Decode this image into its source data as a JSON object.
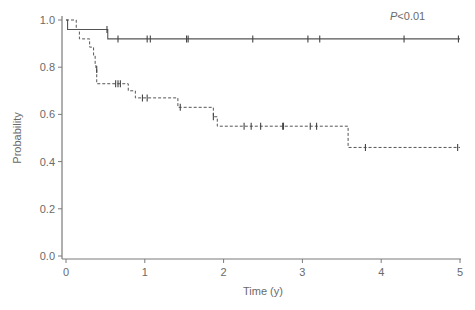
{
  "chart_data": {
    "type": "line",
    "subtype": "kaplan-meier step",
    "title": "",
    "xlabel": "Time (y)",
    "ylabel": "Probability",
    "xlim": [
      0,
      5
    ],
    "ylim": [
      0,
      1.0
    ],
    "xticks": [
      "0",
      "1",
      "2",
      "3",
      "4",
      "5"
    ],
    "yticks": [
      "0.0",
      "0.2",
      "0.4",
      "0.6",
      "0.8",
      "1.0"
    ],
    "grid": false,
    "legend": null,
    "annotations": [
      {
        "text_italic": "P",
        "text": "<0.01",
        "x": 4.1,
        "y": 0.98
      }
    ],
    "series": [
      {
        "name": "group-solid",
        "style": "solid",
        "steps": [
          [
            0,
            1.0
          ],
          [
            0.02,
            0.96
          ],
          [
            0.53,
            0.92
          ],
          [
            5.0,
            0.92
          ]
        ],
        "censored": [
          [
            0.52,
            0.96
          ],
          [
            0.66,
            0.92
          ],
          [
            1.03,
            0.92
          ],
          [
            1.07,
            0.92
          ],
          [
            1.53,
            0.92
          ],
          [
            1.55,
            0.92
          ],
          [
            2.37,
            0.92
          ],
          [
            3.07,
            0.92
          ],
          [
            3.22,
            0.92
          ],
          [
            4.29,
            0.92
          ],
          [
            4.98,
            0.92
          ]
        ]
      },
      {
        "name": "group-dashed",
        "style": "dashed",
        "steps": [
          [
            0,
            1.0
          ],
          [
            0.13,
            0.96
          ],
          [
            0.17,
            0.92
          ],
          [
            0.3,
            0.885
          ],
          [
            0.35,
            0.85
          ],
          [
            0.37,
            0.81
          ],
          [
            0.38,
            0.79
          ],
          [
            0.39,
            0.73
          ],
          [
            0.79,
            0.7
          ],
          [
            0.88,
            0.67
          ],
          [
            1.42,
            0.63
          ],
          [
            1.87,
            0.59
          ],
          [
            1.92,
            0.55
          ],
          [
            3.58,
            0.46
          ],
          [
            5.0,
            0.46
          ]
        ],
        "censored": [
          [
            0.39,
            0.79
          ],
          [
            0.63,
            0.73
          ],
          [
            0.66,
            0.73
          ],
          [
            0.69,
            0.73
          ],
          [
            0.97,
            0.67
          ],
          [
            1.03,
            0.67
          ],
          [
            1.45,
            0.63
          ],
          [
            1.87,
            0.59
          ],
          [
            2.26,
            0.55
          ],
          [
            2.35,
            0.55
          ],
          [
            2.47,
            0.55
          ],
          [
            2.75,
            0.55
          ],
          [
            2.76,
            0.55
          ],
          [
            3.1,
            0.55
          ],
          [
            3.18,
            0.55
          ],
          [
            3.8,
            0.46
          ],
          [
            4.97,
            0.46
          ]
        ]
      }
    ]
  },
  "labels": {
    "xlabel": "Time (y)",
    "ylabel": "Probability",
    "p_italic": "P",
    "p_value": "<0.01"
  }
}
